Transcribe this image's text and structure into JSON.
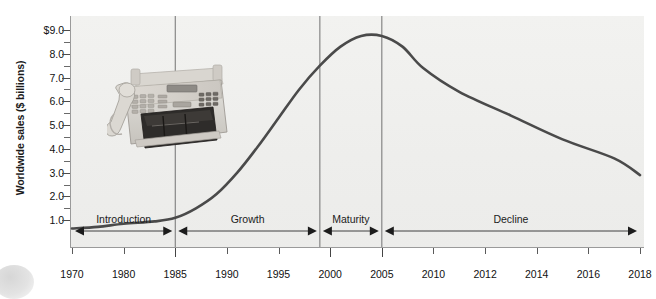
{
  "chart_data": {
    "type": "line",
    "title": "",
    "subtitle": "",
    "xlabel": "",
    "ylabel": "Worldwide sales ($ billions)",
    "xlim": [
      1970,
      2019
    ],
    "ylim": [
      0.0,
      9.0
    ],
    "grid": false,
    "legend_position": "none",
    "y_tick_labels": [
      "$9.0",
      "8.0",
      "7.0",
      "6.0",
      "5.0",
      "4.0",
      "3.0",
      "2.0",
      "1.0"
    ],
    "y_tick_values": [
      9.0,
      8.0,
      7.0,
      6.0,
      5.0,
      4.0,
      3.0,
      2.0,
      1.0
    ],
    "y_minor_ticks": [
      8.5,
      7.5,
      6.5,
      5.5,
      4.5,
      3.5,
      2.5,
      1.5
    ],
    "x_tick_labels": [
      "1970",
      "1980",
      "1985",
      "1990",
      "1995",
      "2000",
      "2005",
      "2010",
      "2012",
      "2014",
      "2016",
      "2018"
    ],
    "x_tick_values": [
      1970,
      1980,
      1985,
      1990,
      1995,
      2000,
      2005,
      2010,
      2012,
      2014,
      2016,
      2018
    ],
    "series": [
      {
        "name": "Worldwide fax machine sales",
        "color": "#4a4a4a",
        "x": [
          1970,
          1975,
          1980,
          1983,
          1985,
          1987,
          1989,
          1991,
          1993,
          1995,
          1997,
          1999,
          2001,
          2003,
          2005,
          2007,
          2009,
          2011,
          2013,
          2015,
          2017,
          2019
        ],
        "y": [
          0.65,
          0.72,
          0.85,
          0.95,
          1.1,
          1.5,
          2.1,
          3.0,
          4.1,
          5.3,
          6.5,
          7.5,
          8.3,
          8.75,
          8.75,
          8.3,
          7.4,
          6.4,
          5.4,
          4.4,
          3.6,
          2.9
        ]
      }
    ],
    "annotations": [
      {
        "label": "Introduction",
        "start_year": 1970,
        "end_year": 1985,
        "type": "stage"
      },
      {
        "label": "Growth",
        "start_year": 1985,
        "end_year": 1999,
        "type": "stage"
      },
      {
        "label": "Maturity",
        "start_year": 1999,
        "end_year": 2005,
        "type": "stage"
      },
      {
        "label": "Decline",
        "start_year": 2005,
        "end_year": 2019,
        "type": "stage"
      }
    ],
    "stage_dividers": [
      1985,
      1999,
      2005
    ],
    "photo": {
      "name": "fax-machine-photo",
      "alt": "Fax machine"
    }
  },
  "axis": {
    "y_title": "Worldwide sales ($ billions)"
  },
  "colors": {
    "curve": "#4a4a4a",
    "panel_background": "#f0f0ee",
    "axis": "#9a9a9a",
    "text": "#111111",
    "divider": "#7d7d7d"
  }
}
